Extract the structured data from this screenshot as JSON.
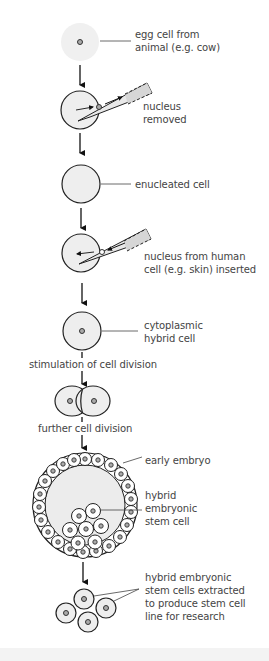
{
  "diagram": {
    "type": "flowchart",
    "title": "",
    "steps": [
      {
        "id": "egg",
        "label": "egg cell from\nanimal (e.g. cow)",
        "line1": "egg cell from",
        "line2": "animal (e.g. cow)"
      },
      {
        "id": "removed",
        "label": "nucleus removed",
        "line1": "nucleus",
        "line2": "removed"
      },
      {
        "id": "enucleated",
        "label": "enucleated cell"
      },
      {
        "id": "inserted",
        "label": "nucleus from human cell (e.g. skin) inserted",
        "line1": "nucleus from human",
        "line2": "cell (e.g. skin) inserted"
      },
      {
        "id": "hybrid",
        "label": "cytoplasmic hybrid cell",
        "line1": "cytoplasmic",
        "line2": "hybrid cell"
      },
      {
        "id": "two-cell",
        "label": ""
      },
      {
        "id": "embryo",
        "label": "early embryo"
      },
      {
        "id": "stem-cells",
        "label": "hybrid embryonic stem cells extracted to produce stem cell line for research"
      }
    ],
    "transitions": [
      {
        "from": "hybrid",
        "to": "two-cell",
        "label": "stimulation of cell division"
      },
      {
        "from": "two-cell",
        "to": "embryo",
        "label": "further cell division"
      }
    ],
    "annotations": {
      "inner_cell_mass": {
        "line1": "hybrid",
        "line2": "embryonic",
        "line3": "stem cell"
      },
      "extracted": {
        "line1": "hybrid embryonic",
        "line2": "stem cells extracted",
        "line3": "to produce stem cell",
        "line4": "line for research"
      }
    },
    "colors": {
      "cell_fill": "#eeeeee",
      "outline": "#222222",
      "pipette_fill": "#d8d8d8",
      "text": "#444444"
    }
  }
}
